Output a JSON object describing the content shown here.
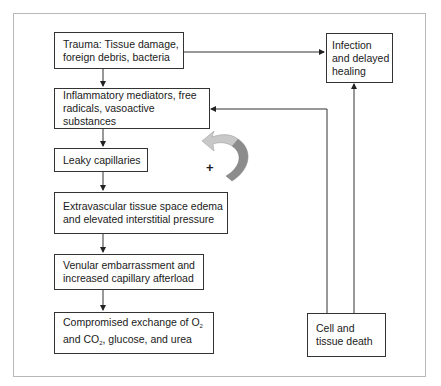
{
  "diagram": {
    "boxes": [
      {
        "id": "trauma",
        "line1": "Trauma: Tissue damage,",
        "line2": "foreign debris, bacteria"
      },
      {
        "id": "inflammatory",
        "line1": "Inflammatory mediators, free",
        "line2": "radicals, vasoactive substances"
      },
      {
        "id": "leaky",
        "line1": "Leaky capillaries"
      },
      {
        "id": "edema",
        "line1": "Extravascular tissue space edema",
        "line2": "and elevated interstitial pressure"
      },
      {
        "id": "venular",
        "line1": "Venular embarrassment and",
        "line2": "increased capillary afterload"
      },
      {
        "id": "compromised",
        "line1_pre": "Compromised exchange of O",
        "line1_sub": "2",
        "line2_pre": "and CO",
        "line2_sub": "2",
        "line2_post": ", glucose, and urea"
      },
      {
        "id": "infection",
        "line1": "Infection",
        "line2": "and delayed",
        "line3": "healing"
      },
      {
        "id": "celldeath",
        "line1": "Cell and",
        "line2": "tissue death"
      }
    ],
    "feedback_symbol": "+",
    "colors": {
      "box_border": "#333333",
      "frame_border": "#b8b8b8",
      "arrow_dark": "#8c8c8c",
      "arrow_light": "#c8c8c8"
    }
  }
}
